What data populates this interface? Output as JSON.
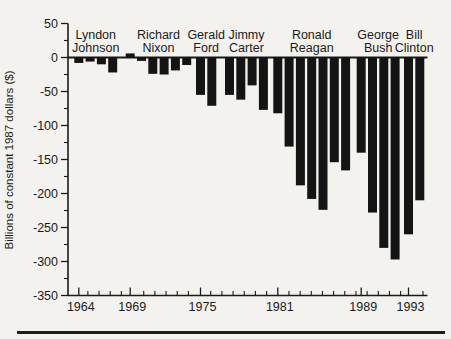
{
  "page": {
    "background_color": "#f3f2ee",
    "ink_color": "#1b1b1b"
  },
  "chart_data": {
    "type": "bar",
    "title": "",
    "xlabel": "",
    "ylabel": "Billions of constant 1987 dollars ($)",
    "ylim": [
      -350,
      50
    ],
    "y_ticks": [
      50,
      0,
      -50,
      -100,
      -150,
      -200,
      -250,
      -300,
      -350
    ],
    "y_minor_tick_interval": 25,
    "grid": false,
    "legend": null,
    "bar_color": "#141414",
    "axis_color": "#1b1b1b",
    "x_tick_labels": [
      "1964",
      "1969",
      "1975",
      "1981",
      "1989",
      "1993"
    ],
    "groups": [
      {
        "president": "Lyndon Johnson",
        "axis_year_label": "1964",
        "years": [
          1964,
          1965,
          1966,
          1967
        ],
        "values": [
          -8,
          -6,
          -10,
          -22
        ]
      },
      {
        "president": "Richard Nixon",
        "axis_year_label": "1969",
        "years": [
          1969,
          1970,
          1971,
          1972,
          1973,
          1974
        ],
        "values": [
          6,
          -5,
          -24,
          -25,
          -19,
          -11
        ]
      },
      {
        "president": "Gerald Ford",
        "axis_year_label": "1975",
        "years": [
          1975,
          1976
        ],
        "values": [
          -55,
          -71
        ]
      },
      {
        "president": "Jimmy Carter",
        "axis_year_label": null,
        "years": [
          1977,
          1978,
          1979,
          1980
        ],
        "values": [
          -55,
          -62,
          -41,
          -77
        ]
      },
      {
        "president": "Ronald Reagan",
        "axis_year_label": "1981",
        "years": [
          1981,
          1982,
          1983,
          1984,
          1985,
          1986,
          1987
        ],
        "values": [
          -82,
          -131,
          -188,
          -208,
          -224,
          -154,
          -166
        ]
      },
      {
        "president": "George Bush",
        "axis_year_label": "1989",
        "years": [
          1989,
          1990,
          1991,
          1992
        ],
        "values": [
          -140,
          -228,
          -280,
          -297
        ]
      },
      {
        "president": "Bill Clinton",
        "axis_year_label": "1993",
        "years": [
          1993,
          1994
        ],
        "values": [
          -260,
          -210
        ]
      }
    ]
  }
}
